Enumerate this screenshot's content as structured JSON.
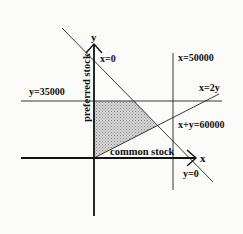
{
  "diagram": {
    "type": "linear-programming-feasible-region",
    "axes": {
      "x_label": "x",
      "y_label": "y",
      "x_axis_title": "common stock",
      "y_axis_title": "preferred stock"
    },
    "constraint_labels": {
      "x0": "x=0",
      "y0": "y=0",
      "y35000": "y=35000",
      "x50000": "x=50000",
      "x2y": "x=2y",
      "sum60000": "x+y=60000"
    },
    "feasible_region": {
      "fill": "shaded/stippled gray",
      "bounded_by": [
        "x=0",
        "y=35000",
        "x+y=60000",
        "x=2y"
      ]
    },
    "colors": {
      "background": "#fbfbfa",
      "line": "#1a1a1a",
      "shade": "#bdbdbd"
    }
  }
}
